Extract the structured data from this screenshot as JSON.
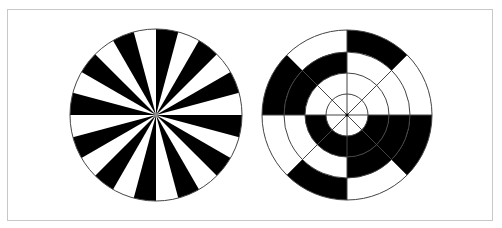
{
  "figure": {
    "width": 502,
    "height": 228,
    "frame": {
      "x": 7,
      "y": 9,
      "w": 486,
      "h": 212,
      "stroke": "#c8c8c8"
    },
    "colors": {
      "fill": "#000000",
      "background": "#ffffff",
      "line": "#444444"
    },
    "panels": [
      {
        "name": "radial-sector-pattern",
        "cx": 156,
        "cy": 115,
        "r": 86,
        "sectors": 24,
        "start_angle_deg": 0,
        "first_sector_color": "black",
        "alternating": true
      },
      {
        "name": "concentric-ring-pattern",
        "cx": 347,
        "cy": 115,
        "ring_radii": [
          21,
          42,
          63,
          85
        ],
        "sectors": 8,
        "spokes_in_inner_ring": 8,
        "filled_cells": {
          "ring1": [],
          "ring2": [
            2,
            3,
            4,
            5
          ],
          "ring3": [
            2,
            3,
            6,
            7
          ],
          "ring4": [
            0,
            2,
            4,
            6
          ]
        },
        "sector_lines": [
          {
            "angle_deg": 0,
            "from_r": 0,
            "to_r": 85
          },
          {
            "angle_deg": 90,
            "from_r": 0,
            "to_r": 85
          },
          {
            "angle_deg": 180,
            "from_r": 0,
            "to_r": 85
          },
          {
            "angle_deg": 270,
            "from_r": 0,
            "to_r": 85
          },
          {
            "angle_deg": 45,
            "from_r": 0,
            "to_r": 85
          },
          {
            "angle_deg": 135,
            "from_r": 0,
            "to_r": 85
          },
          {
            "angle_deg": 225,
            "from_r": 0,
            "to_r": 85
          },
          {
            "angle_deg": 315,
            "from_r": 0,
            "to_r": 63
          }
        ]
      }
    ]
  }
}
